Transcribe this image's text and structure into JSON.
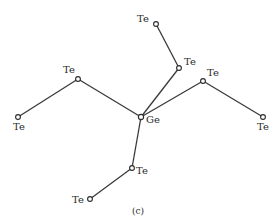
{
  "diagram": {
    "caption": "(c)",
    "center": {
      "id": "ge",
      "element": "Ge",
      "x": 141,
      "y": 117,
      "label_dx": 5,
      "label_dy": 6
    },
    "atoms": [
      {
        "id": "te_up1",
        "element": "Te",
        "x": 179,
        "y": 68,
        "label_dx": 5,
        "label_dy": -3
      },
      {
        "id": "te_up2",
        "element": "Te",
        "x": 156,
        "y": 24,
        "label_dx": -19,
        "label_dy": -2
      },
      {
        "id": "te_left1",
        "element": "Te",
        "x": 78,
        "y": 79,
        "label_dx": -15,
        "label_dy": -6
      },
      {
        "id": "te_left2",
        "element": "Te",
        "x": 18,
        "y": 117,
        "label_dx": -5,
        "label_dy": 13
      },
      {
        "id": "te_right1",
        "element": "Te",
        "x": 203,
        "y": 81,
        "label_dx": 4,
        "label_dy": -5
      },
      {
        "id": "te_right2",
        "element": "Te",
        "x": 263,
        "y": 117,
        "label_dx": -6,
        "label_dy": 13
      },
      {
        "id": "te_down1",
        "element": "Te",
        "x": 132,
        "y": 168,
        "label_dx": 4,
        "label_dy": 6
      },
      {
        "id": "te_down2",
        "element": "Te",
        "x": 90,
        "y": 199,
        "label_dx": -18,
        "label_dy": 4
      }
    ],
    "bonds": [
      [
        "ge",
        "te_up1"
      ],
      [
        "te_up1",
        "te_up2"
      ],
      [
        "ge",
        "te_left1"
      ],
      [
        "te_left1",
        "te_left2"
      ],
      [
        "ge",
        "te_right1"
      ],
      [
        "te_right1",
        "te_right2"
      ],
      [
        "ge",
        "te_down1"
      ],
      [
        "te_down1",
        "te_down2"
      ]
    ],
    "caption_pos": {
      "x": 138,
      "y": 214
    },
    "colors": {
      "line": "#3a3a3a",
      "text": "#2a2a2a",
      "background": "#ffffff"
    }
  }
}
